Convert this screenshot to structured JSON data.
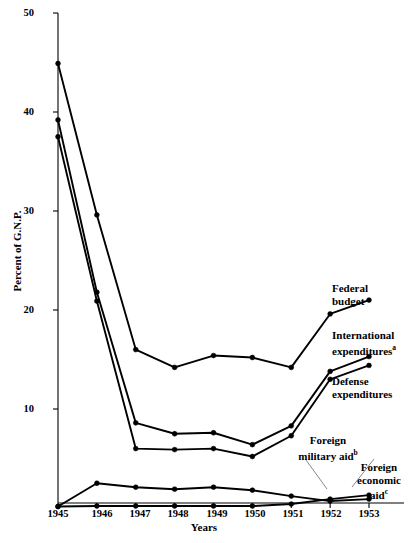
{
  "chart_data": {
    "type": "line",
    "title": "",
    "xlabel": "Years",
    "ylabel": "Percent of G.N.P.",
    "x": [
      1945,
      1946,
      1947,
      1948,
      1949,
      1950,
      1951,
      1952,
      1953
    ],
    "xticklabels": [
      "1945",
      "1946",
      "1947",
      "1948",
      "1949",
      "1950",
      "1951",
      "1952",
      "1953"
    ],
    "yticklabels": [
      "10",
      "20",
      "30",
      "40",
      "50"
    ],
    "yticks": [
      10,
      20,
      30,
      40,
      50
    ],
    "ylim": [
      0,
      50
    ],
    "grid": false,
    "legend_position": "inline-right",
    "series": [
      {
        "name": "Federal budget",
        "label": "Federal",
        "label2": "budget",
        "sup": "",
        "values": [
          44.9,
          29.6,
          16.0,
          14.2,
          15.4,
          15.2,
          14.2,
          19.6,
          21.0
        ]
      },
      {
        "name": "International expenditures",
        "label": "International",
        "label2": "expenditures",
        "sup": "a",
        "values": [
          39.2,
          21.8,
          8.6,
          7.5,
          7.6,
          6.4,
          8.3,
          13.8,
          15.3
        ]
      },
      {
        "name": "Defense expenditures",
        "label": "Defense",
        "label2": "expenditures",
        "sup": "",
        "values": [
          37.5,
          20.9,
          6.0,
          5.9,
          6.0,
          5.2,
          7.3,
          13.0,
          14.4
        ]
      },
      {
        "name": "Foreign military aid",
        "label": "Foreign",
        "label2": "military aid",
        "sup": "b",
        "values": [
          0.15,
          0.2,
          0.2,
          0.2,
          0.2,
          0.2,
          0.4,
          0.9,
          1.3
        ]
      },
      {
        "name": "Foreign economic aid",
        "label": "Foreign",
        "label2": "economic",
        "label3": "aid",
        "sup": "c",
        "values": [
          0.15,
          2.5,
          2.1,
          1.9,
          2.1,
          1.8,
          1.2,
          0.7,
          0.9
        ]
      }
    ]
  },
  "labels": {
    "federal_budget_l1": "Federal",
    "federal_budget_l2": "budget",
    "international_l1": "International",
    "international_l2": "expenditures",
    "international_sup": "a",
    "defense_l1": "Defense",
    "defense_l2": "expenditures",
    "foreign_mil_l1": "Foreign",
    "foreign_mil_l2": "military aid",
    "foreign_mil_sup": "b",
    "foreign_econ_l1": "Foreign",
    "foreign_econ_l2": "economic",
    "foreign_econ_l3": "aid",
    "foreign_econ_sup": "c",
    "ylabel": "Percent of G.N.P.",
    "xlabel": "Years"
  },
  "ticks": {
    "y": [
      "50",
      "40",
      "30",
      "20",
      "10"
    ],
    "x": [
      "1945",
      "1946",
      "1947",
      "1948",
      "1949",
      "1950",
      "1951",
      "1952",
      "1953"
    ]
  },
  "colors": {
    "line": "#000000",
    "axis": "#000000",
    "background": "#ffffff"
  }
}
